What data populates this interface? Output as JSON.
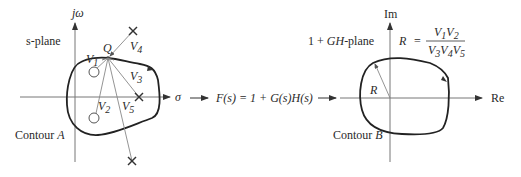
{
  "diagram": {
    "left_panel": {
      "plane_label": "s-plane",
      "axis_vertical_label": "jω",
      "axis_horizontal_label": "σ",
      "contour_label_prefix": "Contour ",
      "contour_label_var": "A",
      "point_label": "Q",
      "vectors": [
        {
          "name": "V",
          "sub": "1",
          "target": "zero-upper"
        },
        {
          "name": "V",
          "sub": "2",
          "target": "zero-lower"
        },
        {
          "name": "V",
          "sub": "3",
          "target": "pole-real"
        },
        {
          "name": "V",
          "sub": "4",
          "target": "pole-upper"
        },
        {
          "name": "V",
          "sub": "5",
          "target": "pole-lower"
        }
      ],
      "poles_count": 3,
      "zeros_count": 2
    },
    "mapping": {
      "function_text": "F(s) = 1 + G(s)H(s)"
    },
    "right_panel": {
      "plane_label_prefix": "1 + ",
      "plane_label_var": "GH",
      "plane_label_suffix": "-plane",
      "axis_vertical_label": "Im",
      "axis_horizontal_label": "Re",
      "radius_label": "R",
      "contour_label_prefix": "Contour ",
      "contour_label_var": "B",
      "equation": {
        "lhs": "R",
        "eq": "=",
        "numerator": "V1V2",
        "denominator": "V3V4V5"
      }
    }
  }
}
